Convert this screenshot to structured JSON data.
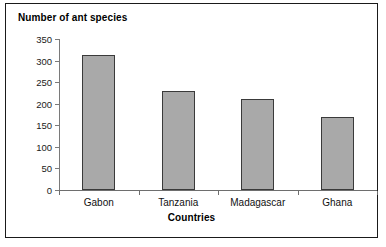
{
  "chart_data": {
    "type": "bar",
    "title": "Number of ant species",
    "xlabel": "Countries",
    "ylabel": "Number of ant species",
    "categories": [
      "Gabon",
      "Tanzania",
      "Madagascar",
      "Ghana"
    ],
    "values": [
      313,
      230,
      210,
      170
    ],
    "ylim": [
      0,
      350
    ],
    "yticks": [
      0,
      50,
      100,
      150,
      200,
      250,
      300,
      350
    ],
    "ytick_labels": [
      "0",
      "50",
      "100",
      "150",
      "200",
      "250",
      "300",
      "350"
    ],
    "grid": false,
    "legend": null,
    "legend_position": "none",
    "bar_fill_color": "#a9a9a9",
    "bar_border_color": "#3a3a3a",
    "axis_color": "#6e6e6e",
    "text_color": "#111111",
    "frame_border_color": "#1a1a1a",
    "background_color": "#ffffff"
  }
}
